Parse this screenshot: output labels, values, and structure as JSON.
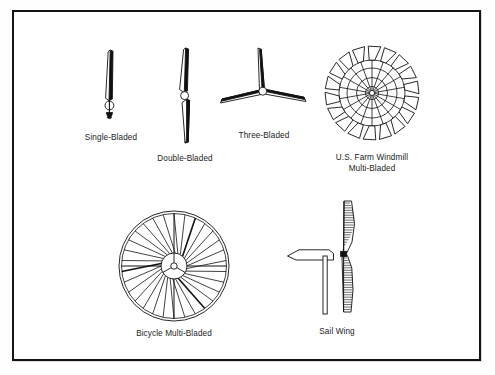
{
  "page": {
    "background_color": "#fefefe",
    "frame_color": "#141414",
    "ink_color": "#1b1b1b",
    "width": 495,
    "height": 375
  },
  "diagram": {
    "type": "illustration-plate",
    "figures": [
      {
        "id": "single-bladed",
        "caption": "Single-Bladed",
        "row": 1,
        "blades": 1,
        "icon": "single-bladed-rotor-icon"
      },
      {
        "id": "double-bladed",
        "caption": "Double-Bladed",
        "row": 1,
        "blades": 2,
        "icon": "double-bladed-rotor-icon"
      },
      {
        "id": "three-bladed",
        "caption": "Three-Bladed",
        "row": 1,
        "blades": 3,
        "icon": "three-bladed-rotor-icon"
      },
      {
        "id": "us-farm-windmill",
        "caption": "U.S. Farm Windmill\nMulti-Bladed",
        "caption_line1": "U.S. Farm Windmill",
        "caption_line2": "Multi-Bladed",
        "row": 1,
        "blades": 18,
        "icon": "farm-windmill-rotor-icon"
      },
      {
        "id": "bicycle-multi-bladed",
        "caption": "Bicycle Multi-Bladed",
        "row": 2,
        "blades": 30,
        "icon": "bicycle-multiblade-rotor-icon"
      },
      {
        "id": "sail-wing",
        "caption": "Sail Wing",
        "row": 2,
        "blades": 2,
        "icon": "sail-wing-rotor-icon"
      }
    ]
  }
}
